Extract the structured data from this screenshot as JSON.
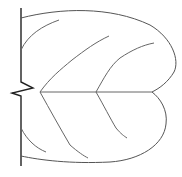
{
  "diagram": {
    "stroke_color_main": "#222222",
    "stroke_color_outline": "#555555",
    "stroke_color_vein": "#666666",
    "background": "#ffffff"
  }
}
